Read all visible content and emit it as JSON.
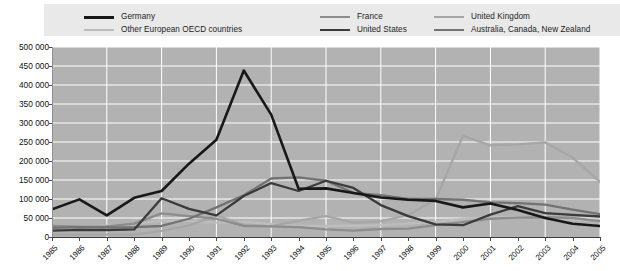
{
  "legend": {
    "columns": [
      {
        "left": 40,
        "width": 230,
        "entries": [
          {
            "label": "Germany",
            "color": "#181818",
            "key": "germany"
          },
          {
            "label": "Other European OECD countries",
            "color": "#bdbdbd",
            "key": "other_european_oecd"
          }
        ]
      },
      {
        "left": 276,
        "width": 150,
        "entries": [
          {
            "label": "France",
            "color": "#8d8d8d",
            "key": "france"
          },
          {
            "label": "United States",
            "color": "#3b3b3b",
            "key": "united_states"
          }
        ]
      },
      {
        "left": 390,
        "width": 190,
        "entries": [
          {
            "label": "United Kingdom",
            "color": "#a6a6a6",
            "key": "united_kingdom"
          },
          {
            "label": "Australia, Canada, New Zealand",
            "color": "#737373",
            "key": "australia_canada_nz"
          }
        ]
      }
    ]
  },
  "chart_data": {
    "type": "line",
    "title": "",
    "xlabel": "",
    "ylabel": "",
    "grid": true,
    "legend_position": "top",
    "xlim": [
      1985,
      2005
    ],
    "ylim": [
      0,
      500000
    ],
    "ytick_step": 50000,
    "yticks": [
      0,
      50000,
      100000,
      150000,
      200000,
      250000,
      300000,
      350000,
      400000,
      450000,
      500000
    ],
    "ytick_labels": [
      "0",
      "50 000",
      "100 000",
      "150 000",
      "200 000",
      "250 000",
      "300 000",
      "350 000",
      "400 000",
      "450 000",
      "500 000"
    ],
    "categories": [
      1985,
      1986,
      1987,
      1988,
      1989,
      1990,
      1991,
      1992,
      1993,
      1994,
      1995,
      1996,
      1997,
      1998,
      1999,
      2000,
      2001,
      2002,
      2003,
      2004,
      2005
    ],
    "xtick_labels": [
      "1985",
      "1986",
      "1987",
      "1988",
      "1989",
      "1990",
      "1991",
      "1992",
      "1993",
      "1994",
      "1995",
      "1996",
      "1997",
      "1998",
      "1999",
      "2000",
      "2001",
      "2002",
      "2003",
      "2004",
      "2005"
    ],
    "series": [
      {
        "name": "Germany",
        "color": "#181818",
        "width": 2.6,
        "values": [
          73000,
          99000,
          57000,
          103000,
          121000,
          193000,
          256000,
          438000,
          322000,
          127000,
          128000,
          116000,
          104000,
          98000,
          95000,
          78000,
          88000,
          71000,
          50000,
          35000,
          29000
        ]
      },
      {
        "name": "Other European OECD countries",
        "color": "#bdbdbd",
        "width": 2.3,
        "values": [
          28000,
          27000,
          30000,
          34000,
          43000,
          42000,
          38000,
          40000,
          34000,
          29000,
          29000,
          30000,
          31000,
          35000,
          40000,
          48000,
          53000,
          52000,
          49000,
          46000,
          43000
        ]
      },
      {
        "name": "France",
        "color": "#8d8d8d",
        "width": 2.3,
        "values": [
          29000,
          27000,
          28000,
          35000,
          62000,
          55000,
          48000,
          29000,
          28000,
          26000,
          20000,
          17000,
          21000,
          22000,
          31000,
          39000,
          48000,
          51000,
          52000,
          50000,
          42000
        ]
      },
      {
        "name": "United States",
        "color": "#3b3b3b",
        "width": 2.3,
        "values": [
          17000,
          19000,
          18000,
          20000,
          102000,
          74000,
          57000,
          108000,
          142000,
          121000,
          148000,
          129000,
          84000,
          55000,
          33000,
          31000,
          59000,
          81000,
          63000,
          58000,
          54000
        ]
      },
      {
        "name": "United Kingdom",
        "color": "#a6a6a6",
        "width": 2.3,
        "values": [
          6000,
          6000,
          6000,
          6000,
          16000,
          30000,
          57000,
          32000,
          28000,
          43000,
          55000,
          38000,
          41000,
          58000,
          98000,
          266000,
          241000,
          244000,
          249000,
          209000,
          145000
        ]
      },
      {
        "name": "Australia, Canada, New Zealand",
        "color": "#737373",
        "width": 2.3,
        "values": [
          24000,
          26000,
          25000,
          26000,
          29000,
          48000,
          78000,
          110000,
          154000,
          157000,
          148000,
          116000,
          110000,
          100000,
          100000,
          98000,
          91000,
          89000,
          85000,
          72000,
          60000
        ]
      }
    ]
  }
}
